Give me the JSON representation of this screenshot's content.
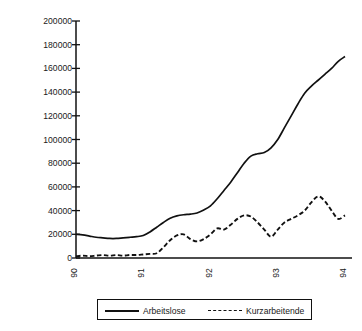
{
  "chart_data": {
    "type": "line",
    "title": "",
    "xlabel": "",
    "ylabel": "Arbeitslose und Kurzarbeitende",
    "xlim": [
      90,
      94
    ],
    "ylim": [
      0,
      200000
    ],
    "grid": false,
    "legend_position": "bottom",
    "x_tick_labels": [
      "90",
      "91",
      "92",
      "93",
      "94"
    ],
    "x_tick_values": [
      90,
      91,
      92,
      93,
      94
    ],
    "y_tick_labels": [
      "200000",
      "180000",
      "160000",
      "140000",
      "120000",
      "100000",
      "80000",
      "60000",
      "40000",
      "20000",
      "0"
    ],
    "y_tick_values": [
      200000,
      180000,
      160000,
      140000,
      120000,
      100000,
      80000,
      60000,
      40000,
      20000,
      0
    ],
    "x": [
      90.0,
      90.1,
      90.2,
      90.3,
      90.4,
      90.5,
      90.6,
      90.7,
      90.8,
      90.9,
      91.0,
      91.1,
      91.2,
      91.3,
      91.4,
      91.5,
      91.6,
      91.7,
      91.8,
      91.9,
      92.0,
      92.1,
      92.2,
      92.3,
      92.4,
      92.5,
      92.6,
      92.7,
      92.8,
      92.9,
      93.0,
      93.1,
      93.2,
      93.3,
      93.4,
      93.5,
      93.6,
      93.7,
      93.8,
      93.9,
      94.0
    ],
    "series": [
      {
        "name": "Arbeitslose",
        "style": "solid",
        "color": "#111111",
        "values": [
          20000,
          19500,
          18500,
          17500,
          17000,
          16500,
          16500,
          17000,
          17500,
          18000,
          19000,
          22000,
          26000,
          30000,
          33500,
          35500,
          36500,
          37000,
          38000,
          40500,
          44000,
          50000,
          57000,
          64000,
          72000,
          80000,
          86000,
          88000,
          89000,
          93000,
          100000,
          110000,
          120000,
          130000,
          139000,
          145000,
          150000,
          155000,
          160000,
          166000,
          170000
        ]
      },
      {
        "name": "Kurzarbeitende",
        "style": "dashed",
        "color": "#111111",
        "values": [
          1500,
          2000,
          1500,
          2000,
          2500,
          2000,
          2500,
          2000,
          2500,
          2500,
          3000,
          3500,
          4000,
          9000,
          15000,
          19000,
          20000,
          16000,
          14000,
          16000,
          20000,
          25000,
          24000,
          28000,
          33000,
          36000,
          35000,
          30000,
          24000,
          18000,
          24000,
          30000,
          33000,
          36000,
          40000,
          47000,
          52000,
          48000,
          40000,
          33000,
          36000
        ]
      }
    ],
    "series_end_values": {
      "Arbeitslose": 186000,
      "Kurzarbeitende": 37000
    }
  },
  "legend": {
    "entries": [
      {
        "label": "Arbeitslose",
        "style": "solid"
      },
      {
        "label": "Kurzarbeitende",
        "style": "dashed"
      }
    ]
  }
}
